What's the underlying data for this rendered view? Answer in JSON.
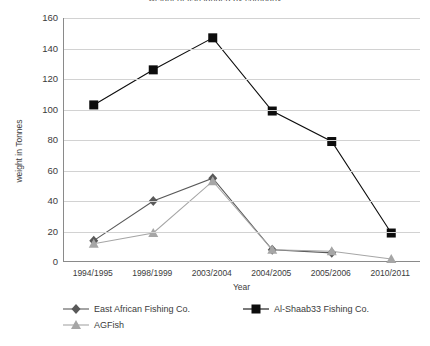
{
  "title_clipped": "weight of fish landed by company",
  "axes": {
    "ylabel": "weight in Tonnes",
    "xlabel": "Year",
    "yticks": [
      "160",
      "140",
      "120",
      "100",
      "80",
      "60",
      "40",
      "20",
      "0"
    ]
  },
  "legend": {
    "items": [
      {
        "label": "East African Fishing Co.",
        "marker": "diamond-marker-icon",
        "color": "#595959"
      },
      {
        "label": "Al-Shaab33 Fishing Co.",
        "marker": "square-marker-icon",
        "color": "#0d0d0d"
      },
      {
        "label": "AGFish",
        "marker": "triangle-marker-icon",
        "color": "#a6a6a6"
      }
    ]
  },
  "chart_data": {
    "type": "line",
    "title": "weight of fish landed by company",
    "xlabel": "Year",
    "ylabel": "weight in Tonnes",
    "ylim": [
      0,
      160
    ],
    "ytick_step": 20,
    "grid": true,
    "legend_position": "bottom",
    "categories": [
      "1994/1995",
      "1998/1999",
      "2003/2004",
      "2004/2005",
      "2005/2006",
      "2010/2011"
    ],
    "series": [
      {
        "name": "East African Fishing Co.",
        "marker": "diamond",
        "color": "#595959",
        "values": [
          14,
          40,
          55,
          8,
          6,
          null
        ]
      },
      {
        "name": "Al-Shaab33 Fishing Co.",
        "marker": "square",
        "color": "#0d0d0d",
        "values": [
          103,
          126,
          147,
          99,
          79,
          19
        ]
      },
      {
        "name": "AGFish",
        "marker": "triangle",
        "color": "#a6a6a6",
        "values": [
          12,
          19,
          53,
          8,
          7,
          2
        ]
      }
    ]
  }
}
